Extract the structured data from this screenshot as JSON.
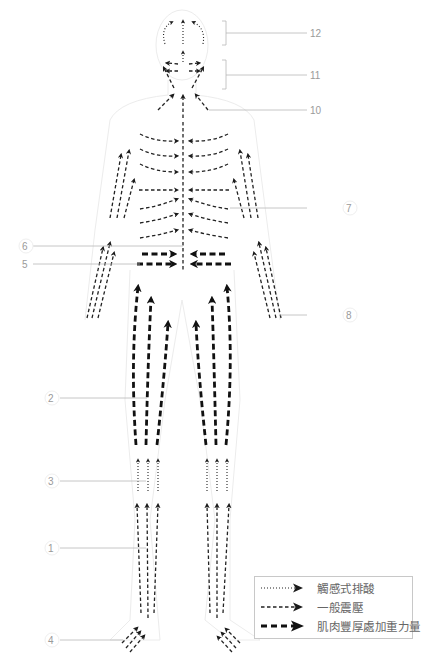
{
  "figure": {
    "title": "",
    "callout_numbers": [
      "1",
      "2",
      "3",
      "4",
      "5",
      "6",
      "7",
      "8",
      "10",
      "11",
      "12"
    ]
  },
  "callouts": {
    "c1": "1",
    "c2": "2",
    "c3": "3",
    "c4": "4",
    "c5": "5",
    "c6": "6",
    "c7": "7",
    "c8": "8",
    "c10": "10",
    "c11": "11",
    "c12": "12"
  },
  "legend": {
    "items": [
      {
        "style": "dotted",
        "label": "觸感式排酸"
      },
      {
        "style": "dashed",
        "label": "一般震壓"
      },
      {
        "style": "bold-dashed",
        "label": "肌肉豐厚處加重力量"
      }
    ]
  },
  "colors": {
    "arrow": "#222222",
    "leader_line": "#b8b8b8",
    "callout_text": "#9a9a9a",
    "body_outline": "#ececec"
  }
}
